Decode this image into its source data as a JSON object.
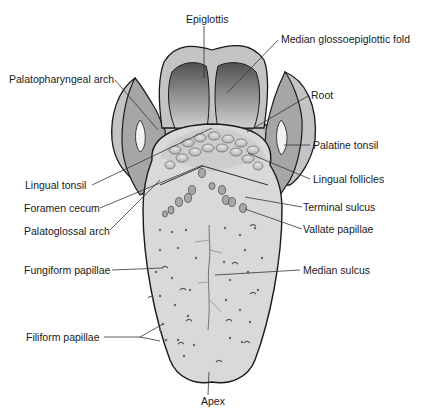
{
  "diagram": {
    "labels": {
      "epiglottis": "Epiglottis",
      "median_glossoepiglottic_fold": "Median glossoepiglottic fold",
      "palatopharyngeal_arch": "Palatopharyngeal arch",
      "root": "Root",
      "palatine_tonsil": "Palatine tonsil",
      "lingual_tonsil": "Lingual tonsil",
      "lingual_follicles": "Lingual follicles",
      "foramen_cecum": "Foramen cecum",
      "terminal_sulcus": "Terminal sulcus",
      "palatoglossal_arch": "Palatoglossal arch",
      "vallate_papillae": "Vallate papillae",
      "fungiform_papillae": "Fungiform papillae",
      "median_sulcus": "Median sulcus",
      "filiform_papillae": "Filiform papillae",
      "apex": "Apex"
    },
    "colors": {
      "outline": "#1a1a1a",
      "tongue_body": "#d9d9d9",
      "pharynx_wall": "#a6a6a6",
      "outer_rim": "#c4c4c4",
      "epiglottis_dark": "#555555",
      "epiglottis_light": "#cfcfcf",
      "tonsil": "#f2f2f2",
      "leader_line": "#333333"
    }
  }
}
